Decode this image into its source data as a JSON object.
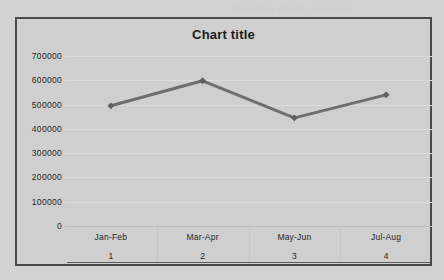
{
  "artifact": {
    "bleed_text": "Excel 2007 tutorial - chart title"
  },
  "chart_data": {
    "type": "line",
    "title": "Chart title",
    "xlabel": "",
    "ylabel": "",
    "categories": [
      "Jan-Feb",
      "Mar-Apr",
      "May-Jun",
      "Jul-Aug"
    ],
    "category_indices": [
      "1",
      "2",
      "3",
      "4"
    ],
    "values": [
      495000,
      598000,
      445000,
      540000
    ],
    "ylim": [
      0,
      700000
    ],
    "ytick_labels": [
      "700000",
      "600000",
      "500000",
      "400000",
      "300000",
      "200000",
      "100000",
      "0"
    ],
    "ytick_values": [
      700000,
      600000,
      500000,
      400000,
      300000,
      200000,
      100000,
      0
    ],
    "grid": true,
    "legend": false,
    "series": [
      {
        "name": "Series 1",
        "values": [
          495000,
          598000,
          445000,
          540000
        ],
        "line_color": "#6e6e6e",
        "marker_color": "#5f5f5f",
        "marker": "diamond"
      }
    ],
    "colors": {
      "plot_background": "#cfcfcf",
      "page_background": "#d2d2d2",
      "frame_border": "#4a4a4a",
      "gridline": "#dcdcdc",
      "text": "#1f1f1f"
    }
  }
}
